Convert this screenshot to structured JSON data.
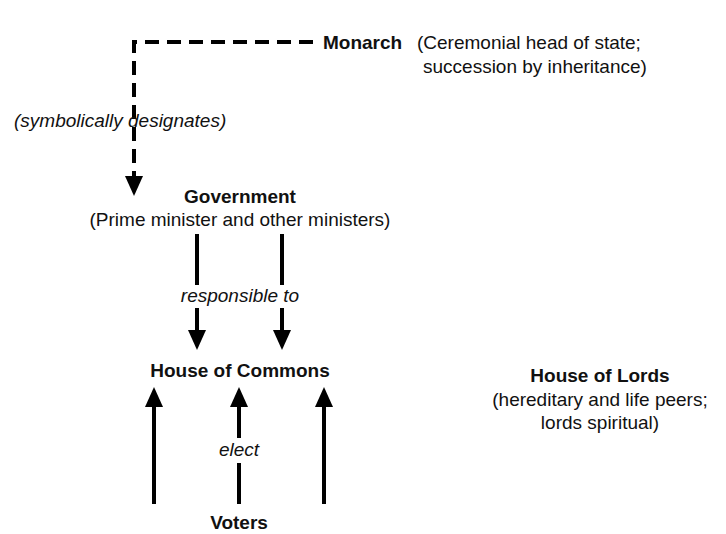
{
  "nodes": {
    "monarch": {
      "title": "Monarch",
      "desc_line1": "(Ceremonial head of state;",
      "desc_line2": "succession by inheritance)"
    },
    "government": {
      "title": "Government",
      "desc": "(Prime minister and other ministers)"
    },
    "commons": {
      "title": "House of Commons"
    },
    "lords": {
      "title": "House of Lords",
      "desc_line1": "(hereditary and life peers;",
      "desc_line2": "lords spiritual)"
    },
    "voters": {
      "title": "Voters"
    }
  },
  "edges": {
    "monarch_to_government": "(symbolically designates)",
    "government_to_commons": "responsible to",
    "voters_to_commons": "elect"
  }
}
